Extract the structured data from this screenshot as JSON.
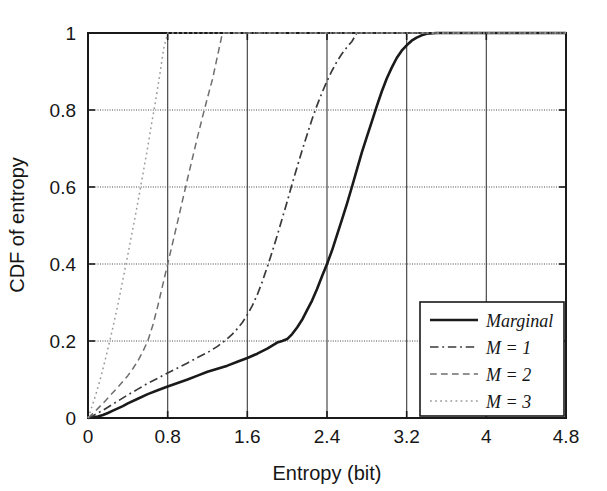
{
  "chart_data": {
    "type": "line",
    "title": "",
    "xlabel": "Entropy (bit)",
    "ylabel": "CDF of entropy",
    "xlim": [
      0,
      4.8
    ],
    "ylim": [
      0,
      1
    ],
    "xticks": [
      "0",
      "0.8",
      "1.6",
      "2.4",
      "3.2",
      "4",
      "4.8"
    ],
    "xtick_values": [
      0,
      0.8,
      1.6,
      2.4,
      3.2,
      4,
      4.8
    ],
    "yticks": [
      "0",
      "0.2",
      "0.4",
      "0.6",
      "0.8",
      "1"
    ],
    "ytick_values": [
      0,
      0.2,
      0.4,
      0.6,
      0.8,
      1
    ],
    "grid": true,
    "legend_position": "lower right",
    "series": [
      {
        "name": "Marginal",
        "style": "solid",
        "color": "#1a1a1a",
        "width": 2.6,
        "x": [
          0.0,
          0.05,
          0.1,
          0.15,
          0.2,
          0.25,
          0.3,
          0.35,
          0.4,
          0.5,
          0.6,
          0.7,
          0.8,
          0.9,
          1.0,
          1.1,
          1.2,
          1.3,
          1.4,
          1.5,
          1.6,
          1.7,
          1.8,
          1.85,
          1.9,
          1.95,
          2.0,
          2.05,
          2.1,
          2.15,
          2.2,
          2.25,
          2.3,
          2.35,
          2.4,
          2.45,
          2.5,
          2.55,
          2.6,
          2.65,
          2.7,
          2.75,
          2.8,
          2.85,
          2.9,
          2.95,
          3.0,
          3.05,
          3.1,
          3.15,
          3.2,
          3.25,
          3.3,
          3.35,
          3.4,
          3.5
        ],
        "y": [
          0.0,
          0.002,
          0.004,
          0.008,
          0.013,
          0.019,
          0.025,
          0.031,
          0.038,
          0.05,
          0.062,
          0.072,
          0.082,
          0.091,
          0.1,
          0.11,
          0.12,
          0.128,
          0.136,
          0.146,
          0.156,
          0.167,
          0.18,
          0.188,
          0.196,
          0.2,
          0.205,
          0.218,
          0.235,
          0.255,
          0.28,
          0.305,
          0.335,
          0.368,
          0.4,
          0.435,
          0.475,
          0.515,
          0.556,
          0.6,
          0.645,
          0.69,
          0.73,
          0.77,
          0.81,
          0.848,
          0.882,
          0.91,
          0.935,
          0.954,
          0.968,
          0.98,
          0.988,
          0.994,
          0.998,
          1.0
        ]
      },
      {
        "name": "M = 1",
        "style": "dashdot",
        "color": "#3a3a3a",
        "width": 1.7,
        "x": [
          0.0,
          0.05,
          0.1,
          0.15,
          0.2,
          0.25,
          0.3,
          0.4,
          0.5,
          0.6,
          0.7,
          0.8,
          0.9,
          1.0,
          1.1,
          1.2,
          1.3,
          1.35,
          1.4,
          1.45,
          1.5,
          1.55,
          1.6,
          1.65,
          1.7,
          1.75,
          1.8,
          1.85,
          1.9,
          1.95,
          2.0,
          2.05,
          2.1,
          2.15,
          2.2,
          2.25,
          2.3,
          2.35,
          2.4,
          2.45,
          2.5,
          2.55,
          2.6,
          2.65,
          2.7
        ],
        "y": [
          0.0,
          0.006,
          0.013,
          0.02,
          0.028,
          0.036,
          0.044,
          0.06,
          0.075,
          0.09,
          0.103,
          0.117,
          0.13,
          0.143,
          0.157,
          0.17,
          0.186,
          0.196,
          0.206,
          0.218,
          0.232,
          0.248,
          0.268,
          0.292,
          0.32,
          0.354,
          0.392,
          0.432,
          0.474,
          0.518,
          0.562,
          0.608,
          0.652,
          0.695,
          0.736,
          0.776,
          0.812,
          0.845,
          0.875,
          0.902,
          0.926,
          0.946,
          0.963,
          0.978,
          1.0
        ]
      },
      {
        "name": "M = 2",
        "style": "dashed",
        "color": "#6e6e6e",
        "width": 1.5,
        "x": [
          0.0,
          0.05,
          0.1,
          0.15,
          0.2,
          0.25,
          0.3,
          0.35,
          0.4,
          0.45,
          0.5,
          0.55,
          0.6,
          0.65,
          0.7,
          0.75,
          0.8,
          0.85,
          0.9,
          0.95,
          1.0,
          1.05,
          1.1,
          1.15,
          1.2,
          1.25,
          1.3,
          1.35
        ],
        "y": [
          0.0,
          0.012,
          0.025,
          0.038,
          0.052,
          0.066,
          0.08,
          0.095,
          0.11,
          0.128,
          0.148,
          0.172,
          0.2,
          0.24,
          0.29,
          0.345,
          0.4,
          0.455,
          0.51,
          0.566,
          0.622,
          0.676,
          0.73,
          0.782,
          0.832,
          0.88,
          0.94,
          1.0
        ]
      },
      {
        "name": "M = 3",
        "style": "dotted",
        "color": "#9a9a9a",
        "width": 1.5,
        "x": [
          0.0,
          0.04,
          0.08,
          0.12,
          0.16,
          0.2,
          0.24,
          0.28,
          0.32,
          0.36,
          0.4,
          0.44,
          0.48,
          0.52,
          0.56,
          0.6,
          0.64,
          0.68,
          0.72,
          0.76,
          0.8
        ],
        "y": [
          0.0,
          0.03,
          0.062,
          0.098,
          0.138,
          0.18,
          0.224,
          0.27,
          0.32,
          0.372,
          0.424,
          0.478,
          0.532,
          0.588,
          0.646,
          0.704,
          0.766,
          0.826,
          0.89,
          0.96,
          1.0
        ]
      }
    ],
    "legend_entries": [
      {
        "label": "Marginal",
        "style": "solid"
      },
      {
        "label": "M = 1",
        "style": "dashdot"
      },
      {
        "label": "M = 2",
        "style": "dashed"
      },
      {
        "label": "M = 3",
        "style": "dotted"
      }
    ]
  }
}
